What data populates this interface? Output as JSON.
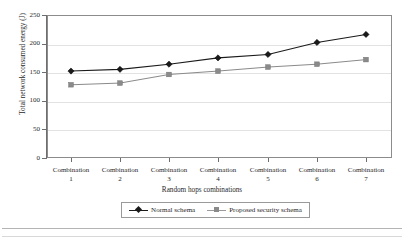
{
  "chart_data": {
    "type": "line",
    "title": "",
    "xlabel": "Random hops combinations",
    "ylabel": "Total network consumed energy (J)",
    "categories": [
      "Combination\n1",
      "Combination\n2",
      "Combination\n3",
      "Combination\n4",
      "Combination\n5",
      "Combination\n6",
      "Combination\n7"
    ],
    "category_lines": [
      {
        "name": "Combination",
        "index": "1"
      },
      {
        "name": "Combination",
        "index": "2"
      },
      {
        "name": "Combination",
        "index": "3"
      },
      {
        "name": "Combination",
        "index": "4"
      },
      {
        "name": "Combination",
        "index": "5"
      },
      {
        "name": "Combination",
        "index": "6"
      },
      {
        "name": "Combination",
        "index": "7"
      }
    ],
    "ylim": [
      0,
      250
    ],
    "yticks": [
      0,
      50,
      100,
      150,
      200,
      250
    ],
    "ytick_labels": [
      "0",
      "50",
      "100",
      "150",
      "200",
      "250"
    ],
    "grid": true,
    "legend_position": "bottom-center",
    "series": [
      {
        "name": "Normal schema",
        "marker": "diamond",
        "color": "#1a1a1a",
        "values": [
          152,
          155,
          164,
          175,
          181,
          202,
          216
        ]
      },
      {
        "name": "Proposed security schema",
        "marker": "square",
        "color": "#8a8a8a",
        "values": [
          128,
          131,
          146,
          152,
          159,
          164,
          172
        ]
      }
    ]
  },
  "legend": {
    "entries": [
      {
        "label": "Normal schema"
      },
      {
        "label": "Proposed security schema"
      }
    ]
  },
  "colors": {
    "series_normal": "#1a1a1a",
    "series_proposed": "#8a8a8a",
    "grid": "#e2e2e2",
    "axis": "#6e6e6e",
    "frame": "#8c8c8c"
  }
}
